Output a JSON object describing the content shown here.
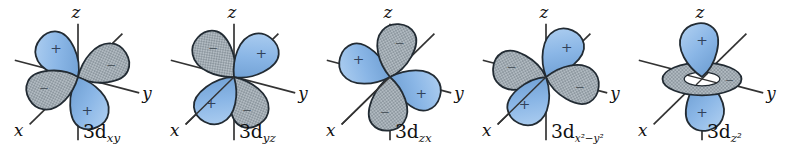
{
  "figure": {
    "title_semantic": "Five 3d atomic orbitals",
    "axis_labels": {
      "x": "x",
      "y": "y",
      "z": "z"
    },
    "colors": {
      "positive_lobe": "#8ab6e6",
      "positive_lobe_light": "#b3d2f2",
      "positive_lobe_dark": "#6f9fd3",
      "negative_lobe": "#b2bbc2",
      "negative_lobe_hatch": "#76828b",
      "outline": "#222b33",
      "axis": "#333333",
      "label": "#111111",
      "plus_sign": "#31425a",
      "minus_sign": "#4e5860",
      "background": "#ffffff"
    },
    "orbitals": [
      {
        "id": "3dxy",
        "label_base": "3d",
        "label_sub": "xy",
        "type": "planar",
        "x_axis_overlay": false,
        "lobes": [
          {
            "angle": -38,
            "sign": "+",
            "kind": "positive"
          },
          {
            "angle": 70,
            "sign": "−",
            "kind": "negative"
          },
          {
            "angle": 165,
            "sign": "+",
            "kind": "positive"
          },
          {
            "angle": -108,
            "sign": "−",
            "kind": "negative"
          }
        ]
      },
      {
        "id": "3dyz",
        "label_base": "3d",
        "label_sub": "yz",
        "type": "planar",
        "x_axis_overlay": true,
        "lobes": [
          {
            "angle": -36,
            "sign": "−",
            "kind": "negative"
          },
          {
            "angle": 50,
            "sign": "+",
            "kind": "positive"
          },
          {
            "angle": 158,
            "sign": "−",
            "kind": "negative"
          },
          {
            "angle": -140,
            "sign": "+",
            "kind": "positive"
          }
        ]
      },
      {
        "id": "3dzx",
        "label_base": "3d",
        "label_sub": "zx",
        "type": "planar",
        "x_axis_overlay": true,
        "lobes": [
          {
            "angle": -62,
            "sign": "+",
            "kind": "positive"
          },
          {
            "angle": 16,
            "sign": "−",
            "kind": "negative"
          },
          {
            "angle": 118,
            "sign": "+",
            "kind": "positive"
          },
          {
            "angle": -172,
            "sign": "−",
            "kind": "negative"
          }
        ]
      },
      {
        "id": "3dx2-y2",
        "label_base": "3d",
        "label_sub": "x²−y²",
        "type": "planar",
        "x_axis_overlay": true,
        "lobes": [
          {
            "angle": -74,
            "sign": "−",
            "kind": "negative"
          },
          {
            "angle": 36,
            "sign": "+",
            "kind": "positive"
          },
          {
            "angle": 107,
            "sign": "−",
            "kind": "negative"
          },
          {
            "angle": -143,
            "sign": "+",
            "kind": "positive"
          }
        ]
      },
      {
        "id": "3dz2",
        "label_base": "3d",
        "label_sub": "z²",
        "type": "axial",
        "x_axis_overlay": false,
        "lobes": [
          {
            "angle": 0,
            "sign": "+",
            "kind": "positive"
          },
          {
            "angle": 180,
            "sign": "+",
            "kind": "positive"
          }
        ],
        "torus": {
          "sign": "−",
          "kind": "negative"
        }
      }
    ]
  }
}
